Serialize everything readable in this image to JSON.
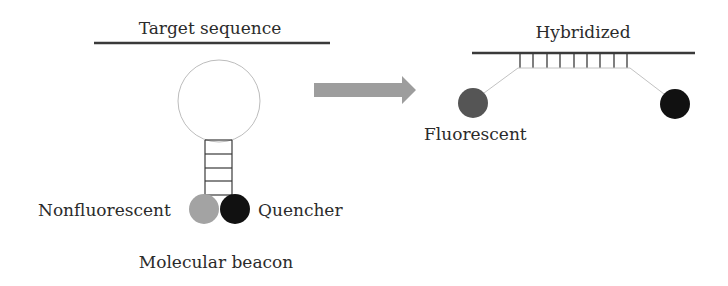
{
  "diagram": {
    "left_panel": {
      "strand_label": "Target sequence",
      "caption": "Molecular beacon",
      "left_label": "Nonfluorescent",
      "right_label": "Quencher",
      "stem_rungs": 4
    },
    "arrow": {
      "direction": "right",
      "color": "#9d9d9d"
    },
    "right_panel": {
      "strand_label": "Hybridized",
      "left_label": "Fluorescent",
      "hybrid_ticks": 9
    },
    "colors": {
      "strand": "#3a3a3a",
      "loop": "#bdbdbd",
      "nonfluorescent_dot": "#a3a3a3",
      "fluorescent_dot": "#555555",
      "quencher_dot": "#111111",
      "linker": "#c2c2c2"
    }
  }
}
